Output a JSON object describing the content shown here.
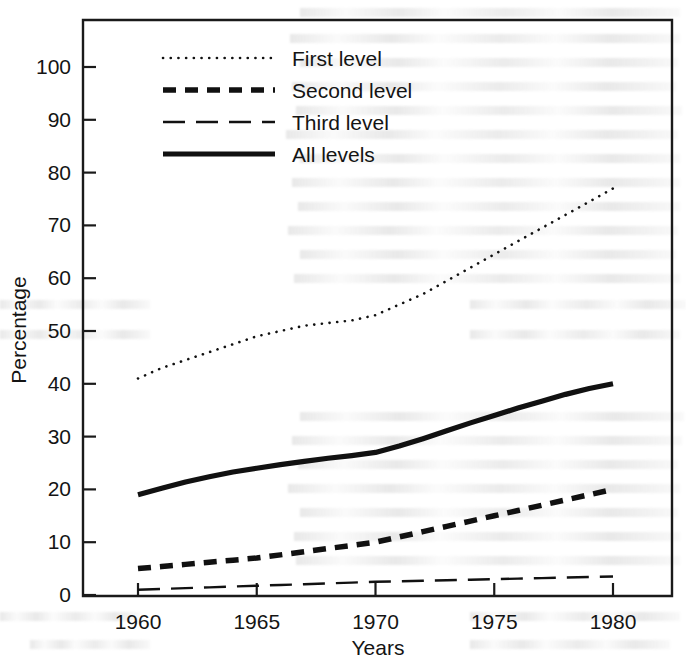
{
  "chart_data": {
    "type": "line",
    "title": "",
    "subtitle": "",
    "xlabel": "Years",
    "ylabel": "Percentage",
    "xlim": [
      1958,
      1982
    ],
    "ylim": [
      0,
      105
    ],
    "xticks": [
      1960,
      1965,
      1970,
      1975,
      1980
    ],
    "xtick_labels": [
      "1960",
      "1965",
      "1970",
      "1975",
      "1980"
    ],
    "yticks": [
      0,
      10,
      20,
      30,
      40,
      50,
      60,
      70,
      80,
      90,
      100
    ],
    "ytick_labels": [
      "0",
      "10",
      "20",
      "30",
      "40",
      "50",
      "60",
      "70",
      "80",
      "90",
      "100"
    ],
    "grid": false,
    "legend_position": "upper-left-inside",
    "x": [
      1960,
      1961,
      1962,
      1963,
      1964,
      1965,
      1966,
      1967,
      1968,
      1969,
      1970,
      1971,
      1972,
      1973,
      1974,
      1975,
      1976,
      1977,
      1978,
      1979,
      1980
    ],
    "series": [
      {
        "name": "First level",
        "style": "dotted",
        "color": "#111111",
        "linewidth": 2.6,
        "values": [
          41,
          43,
          44.5,
          46,
          47.5,
          49,
          50,
          51,
          51.5,
          52,
          53,
          55,
          57,
          59.5,
          62,
          64.5,
          67,
          69.5,
          72,
          74.5,
          77
        ]
      },
      {
        "name": "Second level",
        "style": "dashed-thick",
        "color": "#111111",
        "linewidth": 5.5,
        "values": [
          5,
          5.4,
          5.8,
          6.2,
          6.6,
          7,
          7.6,
          8.2,
          8.8,
          9.4,
          10,
          11,
          12,
          13,
          14,
          15,
          16,
          17,
          18,
          19,
          20
        ]
      },
      {
        "name": "Third level",
        "style": "long-dashed-thin",
        "color": "#111111",
        "linewidth": 2.4,
        "values": [
          1,
          1.15,
          1.3,
          1.45,
          1.6,
          1.75,
          1.9,
          2.05,
          2.2,
          2.35,
          2.5,
          2.6,
          2.7,
          2.8,
          2.9,
          3.0,
          3.1,
          3.2,
          3.3,
          3.4,
          3.5
        ]
      },
      {
        "name": "All levels",
        "style": "solid-thick",
        "color": "#111111",
        "linewidth": 5.2,
        "values": [
          19,
          20.2,
          21.4,
          22.4,
          23.3,
          24,
          24.7,
          25.3,
          25.9,
          26.4,
          27,
          28.2,
          29.6,
          31.1,
          32.6,
          34,
          35.4,
          36.7,
          38,
          39.1,
          40
        ]
      }
    ],
    "legend": [
      {
        "label": "First level",
        "style": "dotted"
      },
      {
        "label": "Second level",
        "style": "dashed-thick"
      },
      {
        "label": "Third level",
        "style": "long-dashed-thin"
      },
      {
        "label": "All levels",
        "style": "solid-thick"
      }
    ],
    "annotations": []
  }
}
